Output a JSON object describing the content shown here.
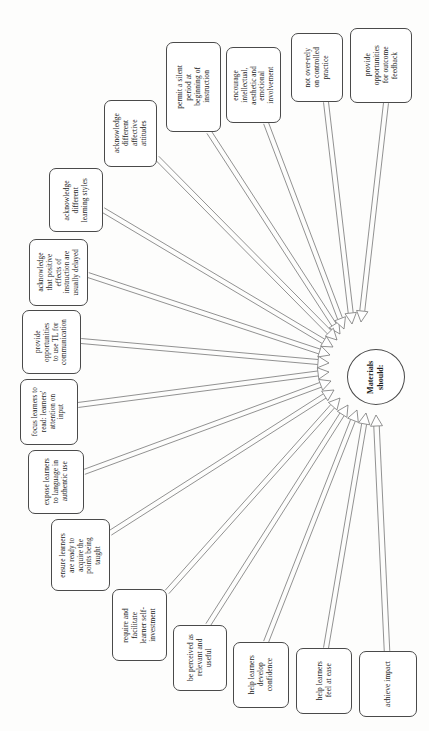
{
  "diagram": {
    "title": "Materials should:",
    "hub": {
      "label": "Materials\nshould:",
      "cx": 376,
      "cy": 377,
      "rx": 29,
      "ry": 28
    },
    "style": {
      "background": "#fdfdfc",
      "node_border": "#4a4a4a",
      "node_fill": "#ffffff",
      "edge_color": "#6e6e6e",
      "text_color": "#1a1a1a"
    },
    "nodes": [
      {
        "id": "n1",
        "name": "node-permit-silent-period",
        "label": "permit a silent\nperiod at\nbeginning of\ninstruction",
        "x": 166,
        "y": 42,
        "w": 55,
        "h": 90,
        "font": 7.4,
        "exit": {
          "x": 209,
          "y": 132
        }
      },
      {
        "id": "n2",
        "name": "node-encourage-involvement",
        "label": "encourage\nintellectual,\naesthetic and\nemotional\ninvolvement",
        "x": 226,
        "y": 47,
        "w": 55,
        "h": 76,
        "font": 7.2,
        "exit": {
          "x": 266,
          "y": 123
        }
      },
      {
        "id": "n3",
        "name": "node-not-over-rely-controlled-practice",
        "label": "not over-rely\non controlled\npractice",
        "x": 291,
        "y": 33,
        "w": 52,
        "h": 69,
        "font": 7.4,
        "exit": {
          "x": 326,
          "y": 102
        }
      },
      {
        "id": "n4",
        "name": "node-provide-outcome-feedback",
        "label": "provide\nopportunities\nfor outcome\nfeedback",
        "x": 350,
        "y": 28,
        "w": 62,
        "h": 75,
        "font": 7.4,
        "exit": {
          "x": 386,
          "y": 103
        }
      },
      {
        "id": "n5",
        "name": "node-acknowledge-affective-attitudes",
        "label": "acknowledge\ndifferent\naffective\nattitudes",
        "x": 104,
        "y": 100,
        "w": 53,
        "h": 67,
        "font": 7.4,
        "exit": {
          "x": 157,
          "y": 158
        }
      },
      {
        "id": "n6",
        "name": "node-acknowledge-learning-styles",
        "label": "acknowledge\ndifferent\nlearning styles",
        "x": 49,
        "y": 168,
        "w": 54,
        "h": 64,
        "font": 7.4,
        "exit": {
          "x": 103,
          "y": 210
        }
      },
      {
        "id": "n7",
        "name": "node-acknowledge-delayed-effects",
        "label": "acknowledge\nthat positive\neffects of\ninstruction are\nusually delayed",
        "x": 29,
        "y": 239,
        "w": 59,
        "h": 67,
        "font": 7.2,
        "exit": {
          "x": 88,
          "y": 275
        }
      },
      {
        "id": "n8",
        "name": "node-provide-tl-communication",
        "label": "provide\nopportunities\nto use TL for\ncommunication",
        "x": 22,
        "y": 310,
        "w": 59,
        "h": 64,
        "font": 7.2,
        "exit": {
          "x": 81,
          "y": 341
        }
      },
      {
        "id": "n9",
        "name": "node-focus-attention-on-input",
        "label": "focus learners to\nread: learners'\nattention on\ninput",
        "x": 20,
        "y": 379,
        "w": 58,
        "h": 66,
        "font": 7.2,
        "exit": {
          "x": 78,
          "y": 405
        }
      },
      {
        "id": "n10",
        "name": "node-expose-authentic-language",
        "label": "expose learners\nto language in\nauthentic use",
        "x": 28,
        "y": 450,
        "w": 56,
        "h": 64,
        "font": 7.4,
        "exit": {
          "x": 84,
          "y": 472
        }
      },
      {
        "id": "n11",
        "name": "node-ensure-readiness",
        "label": "ensure learners\nare ready to\nacquire the\npoints being\ntaught",
        "x": 51,
        "y": 519,
        "w": 59,
        "h": 72,
        "font": 7.2,
        "exit": {
          "x": 110,
          "y": 533
        }
      },
      {
        "id": "n12",
        "name": "node-require-self-investment",
        "label": "require and\nfacilitate\nlearner self-\ninvestment",
        "x": 112,
        "y": 589,
        "w": 55,
        "h": 72,
        "font": 7.4,
        "exit": {
          "x": 167,
          "y": 592
        }
      },
      {
        "id": "n13",
        "name": "node-be-perceived-relevant",
        "label": "be perceived as\nrelevant and\nuseful",
        "x": 173,
        "y": 625,
        "w": 54,
        "h": 66,
        "font": 7.4,
        "exit": {
          "x": 208,
          "y": 625
        }
      },
      {
        "id": "n14",
        "name": "node-help-develop-confidence",
        "label": "help learners\ndevelop\nconfidence",
        "x": 233,
        "y": 642,
        "w": 56,
        "h": 66,
        "font": 7.4,
        "exit": {
          "x": 266,
          "y": 642
        }
      },
      {
        "id": "n15",
        "name": "node-help-feel-at-ease",
        "label": "help learners\nfeel at ease",
        "x": 296,
        "y": 648,
        "w": 56,
        "h": 66,
        "font": 7.4,
        "exit": {
          "x": 326,
          "y": 648
        }
      },
      {
        "id": "n16",
        "name": "node-achieve-impact",
        "label": "achieve impact",
        "x": 359,
        "y": 651,
        "w": 58,
        "h": 66,
        "font": 7.4,
        "exit": {
          "x": 387,
          "y": 651
        }
      }
    ],
    "arrows": [
      {
        "from": "n1",
        "tip": {
          "x": 340,
          "y": 334
        },
        "width": 5.0
      },
      {
        "from": "n2",
        "tip": {
          "x": 344,
          "y": 329
        },
        "width": 5.0
      },
      {
        "from": "n3",
        "tip": {
          "x": 352,
          "y": 324
        },
        "width": 5.0
      },
      {
        "from": "n4",
        "tip": {
          "x": 361,
          "y": 322
        },
        "width": 5.0
      },
      {
        "from": "n5",
        "tip": {
          "x": 337,
          "y": 340
        },
        "width": 5.0
      },
      {
        "from": "n6",
        "tip": {
          "x": 333,
          "y": 347
        },
        "width": 5.0
      },
      {
        "from": "n7",
        "tip": {
          "x": 330,
          "y": 355
        },
        "width": 5.0
      },
      {
        "from": "n8",
        "tip": {
          "x": 329,
          "y": 363
        },
        "width": 5.0
      },
      {
        "from": "n9",
        "tip": {
          "x": 329,
          "y": 372
        },
        "width": 5.0
      },
      {
        "from": "n10",
        "tip": {
          "x": 331,
          "y": 381
        },
        "width": 5.0
      },
      {
        "from": "n11",
        "tip": {
          "x": 334,
          "y": 390
        },
        "width": 5.0
      },
      {
        "from": "n12",
        "tip": {
          "x": 340,
          "y": 398
        },
        "width": 5.0
      },
      {
        "from": "n13",
        "tip": {
          "x": 348,
          "y": 405
        },
        "width": 5.0
      },
      {
        "from": "n14",
        "tip": {
          "x": 357,
          "y": 410
        },
        "width": 5.0
      },
      {
        "from": "n15",
        "tip": {
          "x": 366,
          "y": 413
        },
        "width": 5.0
      },
      {
        "from": "n16",
        "tip": {
          "x": 376,
          "y": 415
        },
        "width": 5.5
      }
    ]
  }
}
